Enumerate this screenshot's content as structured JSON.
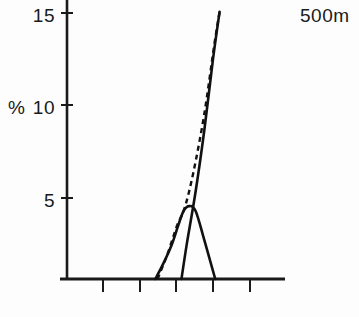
{
  "chart_data": {
    "type": "line",
    "title": "",
    "subtitle": "",
    "xlabel": "",
    "ylabel": "%",
    "annotation": "500m",
    "ylim": [
      0,
      16.5
    ],
    "xlim": [
      0,
      10
    ],
    "grid": false,
    "legend": "none",
    "y_ticks": [
      5,
      10,
      15
    ],
    "y_tick_labels": [
      "5",
      "10",
      "15"
    ],
    "x_ticks": [
      2,
      3,
      4,
      5,
      6
    ],
    "x_tick_labels": [
      "",
      "",
      "",
      "",
      ""
    ],
    "axis_origin_value": 0,
    "series": [
      {
        "name": "bell-curve-solid",
        "style": "solid",
        "x": [
          4.05,
          4.4,
          4.8,
          5.1,
          5.35,
          5.6,
          5.9,
          6.3,
          6.8
        ],
        "y": [
          0.0,
          0.9,
          2.1,
          3.3,
          4.2,
          4.5,
          4.2,
          2.4,
          0.0
        ]
      },
      {
        "name": "steep-rise-solid",
        "style": "solid",
        "x": [
          5.25,
          5.5,
          5.9,
          6.3,
          6.7,
          7.0
        ],
        "y": [
          0.0,
          2.2,
          5.4,
          9.2,
          13.6,
          16.5
        ]
      },
      {
        "name": "steep-rise-dashed",
        "style": "dashed",
        "x": [
          4.15,
          4.6,
          5.05,
          5.4,
          5.8,
          6.3,
          6.75,
          7.0
        ],
        "y": [
          0.0,
          1.5,
          3.3,
          4.4,
          6.6,
          10.2,
          14.4,
          16.5
        ]
      }
    ]
  },
  "labels": {
    "y_axis_unit": "%",
    "tick_15": "15",
    "tick_10": "10",
    "tick_5": "5",
    "depth_annotation": "500m"
  }
}
